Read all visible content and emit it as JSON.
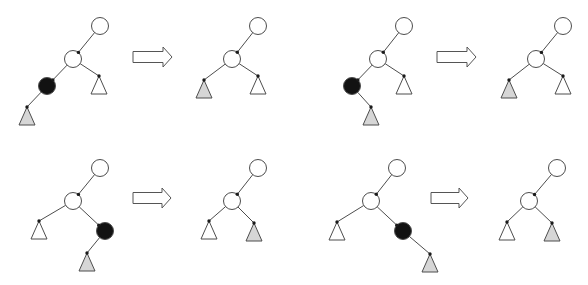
{
  "diagram": {
    "style": {
      "stroke": "#4d4d4d",
      "edge_dot": "#1a1a1a",
      "white": "#ffffff",
      "black": "#121212",
      "gray": "#d6d6d6",
      "arrow_fill": "#ffffff",
      "arrow_stroke": "#555555"
    },
    "node_radius": 8.5,
    "subtree_half_width": 8,
    "subtree_height": 18,
    "transformations": [
      {
        "name": "case-left-left",
        "before": {
          "nodes": [
            {
              "id": "root",
              "kind": "node",
              "fill": "white",
              "x": 100,
              "y": 26
            },
            {
              "id": "mid",
              "kind": "node",
              "fill": "white",
              "x": 73,
              "y": 59
            },
            {
              "id": "removed",
              "kind": "node",
              "fill": "black",
              "x": 47,
              "y": 86
            },
            {
              "id": "sub-right",
              "kind": "subtree",
              "fill": "white",
              "x": 99,
              "y": 76
            },
            {
              "id": "sub-child",
              "kind": "subtree",
              "fill": "gray",
              "x": 27,
              "y": 107
            }
          ],
          "edges": [
            [
              "root",
              "mid"
            ],
            [
              "mid",
              "removed"
            ],
            [
              "mid",
              "sub-right"
            ],
            [
              "removed",
              "sub-child"
            ]
          ]
        },
        "arrow": {
          "x0": 133,
          "x1": 172,
          "cy": 57
        },
        "after": {
          "nodes": [
            {
              "id": "root",
              "kind": "node",
              "fill": "white",
              "x": 258,
              "y": 26
            },
            {
              "id": "mid",
              "kind": "node",
              "fill": "white",
              "x": 232,
              "y": 59
            },
            {
              "id": "sub-left",
              "kind": "subtree",
              "fill": "gray",
              "x": 204,
              "y": 80
            },
            {
              "id": "sub-right",
              "kind": "subtree",
              "fill": "white",
              "x": 258,
              "y": 76
            }
          ],
          "edges": [
            [
              "root",
              "mid"
            ],
            [
              "mid",
              "sub-left"
            ],
            [
              "mid",
              "sub-right"
            ]
          ]
        }
      },
      {
        "name": "case-left-right",
        "before": {
          "nodes": [
            {
              "id": "root",
              "kind": "node",
              "fill": "white",
              "x": 404,
              "y": 26
            },
            {
              "id": "mid",
              "kind": "node",
              "fill": "white",
              "x": 378,
              "y": 59
            },
            {
              "id": "removed",
              "kind": "node",
              "fill": "black",
              "x": 352,
              "y": 86
            },
            {
              "id": "sub-right",
              "kind": "subtree",
              "fill": "white",
              "x": 404,
              "y": 76
            },
            {
              "id": "sub-child",
              "kind": "subtree",
              "fill": "gray",
              "x": 371,
              "y": 107
            }
          ],
          "edges": [
            [
              "root",
              "mid"
            ],
            [
              "mid",
              "removed"
            ],
            [
              "mid",
              "sub-right"
            ],
            [
              "removed",
              "sub-child"
            ]
          ]
        },
        "arrow": {
          "x0": 437,
          "x1": 476,
          "cy": 57
        },
        "after": {
          "nodes": [
            {
              "id": "root",
              "kind": "node",
              "fill": "white",
              "x": 563,
              "y": 26
            },
            {
              "id": "mid",
              "kind": "node",
              "fill": "white",
              "x": 536,
              "y": 59
            },
            {
              "id": "sub-left",
              "kind": "subtree",
              "fill": "gray",
              "x": 509,
              "y": 80
            },
            {
              "id": "sub-right",
              "kind": "subtree",
              "fill": "white",
              "x": 563,
              "y": 76
            }
          ],
          "edges": [
            [
              "root",
              "mid"
            ],
            [
              "mid",
              "sub-left"
            ],
            [
              "mid",
              "sub-right"
            ]
          ]
        }
      },
      {
        "name": "case-right-left",
        "before": {
          "nodes": [
            {
              "id": "root",
              "kind": "node",
              "fill": "white",
              "x": 100,
              "y": 168
            },
            {
              "id": "mid",
              "kind": "node",
              "fill": "white",
              "x": 73,
              "y": 201
            },
            {
              "id": "sub-left",
              "kind": "subtree",
              "fill": "white",
              "x": 39,
              "y": 221
            },
            {
              "id": "removed",
              "kind": "node",
              "fill": "black",
              "x": 105,
              "y": 231
            },
            {
              "id": "sub-child",
              "kind": "subtree",
              "fill": "gray",
              "x": 87,
              "y": 253
            }
          ],
          "edges": [
            [
              "root",
              "mid"
            ],
            [
              "mid",
              "sub-left"
            ],
            [
              "mid",
              "removed"
            ],
            [
              "removed",
              "sub-child"
            ]
          ]
        },
        "arrow": {
          "x0": 133,
          "x1": 171,
          "cy": 198
        },
        "after": {
          "nodes": [
            {
              "id": "root",
              "kind": "node",
              "fill": "white",
              "x": 258,
              "y": 168
            },
            {
              "id": "mid",
              "kind": "node",
              "fill": "white",
              "x": 232,
              "y": 201
            },
            {
              "id": "sub-left",
              "kind": "subtree",
              "fill": "white",
              "x": 209,
              "y": 221
            },
            {
              "id": "sub-right",
              "kind": "subtree",
              "fill": "gray",
              "x": 254,
              "y": 223
            }
          ],
          "edges": [
            [
              "root",
              "mid"
            ],
            [
              "mid",
              "sub-left"
            ],
            [
              "mid",
              "sub-right"
            ]
          ]
        }
      },
      {
        "name": "case-right-right",
        "before": {
          "nodes": [
            {
              "id": "root",
              "kind": "node",
              "fill": "white",
              "x": 397,
              "y": 168
            },
            {
              "id": "mid",
              "kind": "node",
              "fill": "white",
              "x": 371,
              "y": 201
            },
            {
              "id": "sub-left",
              "kind": "subtree",
              "fill": "white",
              "x": 337,
              "y": 222
            },
            {
              "id": "removed",
              "kind": "node",
              "fill": "black",
              "x": 403,
              "y": 231
            },
            {
              "id": "sub-child",
              "kind": "subtree",
              "fill": "gray",
              "x": 430,
              "y": 254
            }
          ],
          "edges": [
            [
              "root",
              "mid"
            ],
            [
              "mid",
              "sub-left"
            ],
            [
              "mid",
              "removed"
            ],
            [
              "removed",
              "sub-child"
            ]
          ]
        },
        "arrow": {
          "x0": 431,
          "x1": 468,
          "cy": 198
        },
        "after": {
          "nodes": [
            {
              "id": "root",
              "kind": "node",
              "fill": "white",
              "x": 557,
              "y": 168
            },
            {
              "id": "mid",
              "kind": "node",
              "fill": "white",
              "x": 529,
              "y": 201
            },
            {
              "id": "sub-left",
              "kind": "subtree",
              "fill": "white",
              "x": 507,
              "y": 222
            },
            {
              "id": "sub-right",
              "kind": "subtree",
              "fill": "gray",
              "x": 552,
              "y": 223
            }
          ],
          "edges": [
            [
              "root",
              "mid"
            ],
            [
              "mid",
              "sub-left"
            ],
            [
              "mid",
              "sub-right"
            ]
          ]
        }
      }
    ]
  }
}
